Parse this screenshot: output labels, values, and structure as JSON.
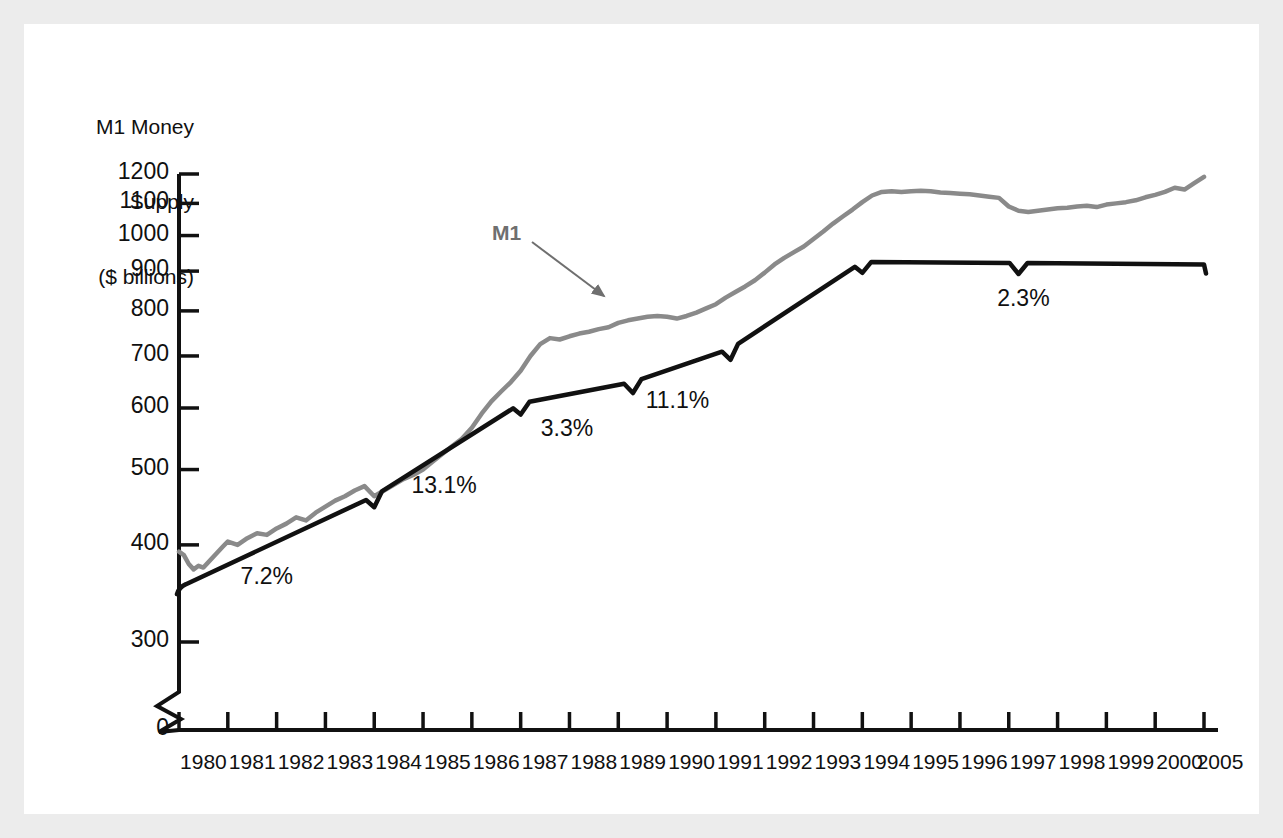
{
  "figure": {
    "background_color": "#ececec",
    "panel_color": "#ffffff"
  },
  "axis_title": {
    "line1": "M1 Money",
    "line2": "Supply",
    "line3": "($ billions)"
  },
  "chart_data": {
    "type": "line",
    "title": "M1 Money Supply ($ billions)",
    "xlabel": "",
    "ylabel": "M1 Money Supply ($ billions)",
    "yscale": "log",
    "ylim": [
      290,
      1240
    ],
    "grid": false,
    "legend_position": "inline-annotation",
    "axis_break": true,
    "axis_break_label": "0",
    "ytick_labels": [
      "1200",
      "1100",
      "1000",
      "900",
      "800",
      "700",
      "600",
      "500",
      "400",
      "300",
      "0"
    ],
    "ytick_values": [
      1200,
      1100,
      1000,
      900,
      800,
      700,
      600,
      500,
      400,
      300,
      0
    ],
    "xtick_labels": [
      "1980",
      "1981",
      "1982",
      "1983",
      "1984",
      "1985",
      "1986",
      "1987",
      "1988",
      "1989",
      "1990",
      "1991",
      "1992",
      "1993",
      "1994",
      "1995",
      "1996",
      "1997",
      "1998",
      "1999",
      "2000",
      "2005"
    ],
    "xlim": [
      1980,
      2001
    ],
    "series": [
      {
        "name": "M1",
        "color": "#8a8a8a",
        "style": "monthly-jagged",
        "x": [
          1980.0,
          1980.1,
          1980.2,
          1980.3,
          1980.4,
          1980.5,
          1980.6,
          1980.7,
          1980.8,
          1980.9,
          1981.0,
          1981.2,
          1981.4,
          1981.6,
          1981.8,
          1982.0,
          1982.2,
          1982.4,
          1982.6,
          1982.8,
          1983.0,
          1983.2,
          1983.4,
          1983.6,
          1983.8,
          1984.0,
          1984.2,
          1984.4,
          1984.6,
          1984.8,
          1985.0,
          1985.2,
          1985.4,
          1985.6,
          1985.8,
          1986.0,
          1986.2,
          1986.4,
          1986.6,
          1986.8,
          1987.0,
          1987.2,
          1987.4,
          1987.6,
          1987.8,
          1988.0,
          1988.2,
          1988.4,
          1988.6,
          1988.8,
          1989.0,
          1989.2,
          1989.4,
          1989.6,
          1989.8,
          1990.0,
          1990.2,
          1990.4,
          1990.6,
          1990.8,
          1991.0,
          1991.2,
          1991.4,
          1991.6,
          1991.8,
          1992.0,
          1992.2,
          1992.4,
          1992.6,
          1992.8,
          1993.0,
          1993.2,
          1993.4,
          1993.6,
          1993.8,
          1994.0,
          1994.2,
          1994.4,
          1994.6,
          1994.8,
          1995.0,
          1995.2,
          1995.4,
          1995.6,
          1995.8,
          1996.0,
          1996.2,
          1996.4,
          1996.6,
          1996.8,
          1997.0,
          1997.2,
          1997.4,
          1997.6,
          1997.8,
          1998.0,
          1998.2,
          1998.4,
          1998.6,
          1998.8,
          1999.0,
          1999.2,
          1999.4,
          1999.6,
          1999.8,
          2000.0,
          2000.2,
          2000.4,
          2000.6,
          2000.8,
          2001.0
        ],
        "y": [
          392,
          388,
          378,
          372,
          376,
          374,
          380,
          386,
          392,
          398,
          404,
          400,
          408,
          414,
          412,
          420,
          426,
          434,
          430,
          440,
          448,
          456,
          462,
          470,
          476,
          462,
          470,
          478,
          486,
          492,
          500,
          512,
          524,
          536,
          548,
          566,
          590,
          612,
          630,
          648,
          670,
          700,
          725,
          738,
          735,
          742,
          748,
          752,
          758,
          762,
          772,
          778,
          782,
          786,
          788,
          786,
          782,
          788,
          796,
          806,
          816,
          832,
          846,
          860,
          876,
          896,
          918,
          936,
          952,
          968,
          990,
          1012,
          1036,
          1058,
          1080,
          1104,
          1126,
          1138,
          1140,
          1138,
          1140,
          1142,
          1140,
          1136,
          1134,
          1132,
          1130,
          1126,
          1122,
          1118,
          1090,
          1076,
          1072,
          1076,
          1080,
          1084,
          1086,
          1090,
          1092,
          1088,
          1096,
          1100,
          1104,
          1110,
          1120,
          1128,
          1138,
          1152,
          1146,
          1168,
          1190
        ]
      },
      {
        "name": "trend",
        "color": "#111111",
        "style": "piecewise-linear-trend",
        "breakpoints_x": [
          1980.0,
          1984.0,
          1987.0,
          1989.3,
          1991.3,
          1994.0,
          1997.2,
          2001.0
        ],
        "breakpoints_y": [
          355,
          462,
          608,
          648,
          715,
          925,
          922,
          918
        ]
      }
    ],
    "annotations": [
      {
        "label": "7.2%",
        "segment_start": 1980.0,
        "segment_end": 1984.0,
        "value": 7.2
      },
      {
        "label": "13.1%",
        "segment_start": 1984.0,
        "segment_end": 1987.0,
        "value": 13.1
      },
      {
        "label": "3.3%",
        "segment_start": 1987.0,
        "segment_end": 1989.3,
        "value": 3.3
      },
      {
        "label": "11.1%",
        "segment_start": 1989.3,
        "segment_end": 1991.3,
        "value": 11.1
      },
      {
        "label": "2.3%",
        "segment_start": 1994.0,
        "segment_end": 2001.0,
        "value": 2.3
      }
    ],
    "series_callout": {
      "label": "M1",
      "color": "#6f6f6f"
    }
  }
}
